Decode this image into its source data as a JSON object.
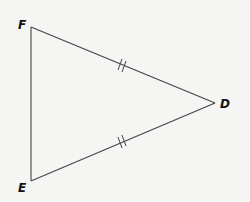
{
  "diagram": {
    "type": "triangle",
    "stroke_color": "#444444",
    "label_color": "#111111",
    "vertices": [
      {
        "name": "F",
        "x": 31,
        "y": 27
      },
      {
        "name": "E",
        "x": 31,
        "y": 181
      },
      {
        "name": "D",
        "x": 215,
        "y": 103
      }
    ],
    "labels": {
      "F": "F",
      "E": "E",
      "D": "D"
    },
    "segments": [
      {
        "from": "F",
        "to": "D",
        "tick_marks": 2
      },
      {
        "from": "E",
        "to": "D",
        "tick_marks": 2
      },
      {
        "from": "F",
        "to": "E",
        "tick_marks": 0
      }
    ],
    "congruence_note": "FD ≅ ED"
  }
}
